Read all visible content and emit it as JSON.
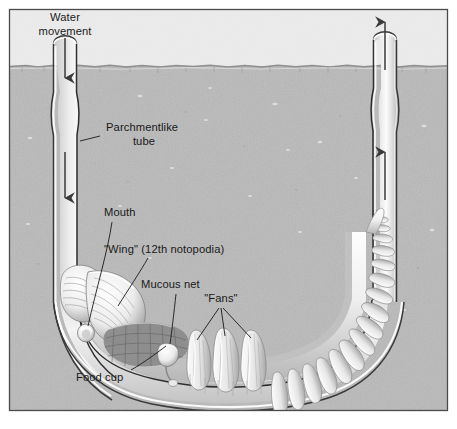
{
  "figure": {
    "background": {
      "water_color": "#eeeeee",
      "sediment_color": "#b9b9b9",
      "sediment_line_y": 66,
      "frame_color": "#4a4a4a"
    }
  },
  "labels": {
    "water_movement": {
      "line1": "Water",
      "line2": "movement"
    },
    "parchmentlike_tube": {
      "line1": "Parchmentlike",
      "line2": "tube"
    },
    "mouth": "Mouth",
    "wing": "\"Wing\" (12th notopodia)",
    "mucous_net": "Mucous net",
    "fans": "\"Fans\"",
    "food_cup": "Food cup"
  },
  "arrows": {
    "inflow": {
      "direction": "down",
      "meaning": "water entering left tube"
    },
    "inflow_lower": {
      "direction": "down",
      "meaning": "water moving down left tube"
    },
    "outflow_top": {
      "direction": "up",
      "meaning": "water exiting right tube"
    },
    "outflow_lower": {
      "direction": "up",
      "meaning": "water moving up right tube"
    }
  },
  "structures": {
    "tube": "U-shaped parchmentlike tube",
    "worm": "segmented worm body inside tube curve",
    "fan_count": 3,
    "parapodia_count": 26
  },
  "colors": {
    "tube_wall": "#3c3c3c",
    "tube_lumen": "#e4e4e4",
    "worm_body": "#f2f2f2",
    "worm_shadow": "#9a9a9a",
    "mucous_net": "#707070"
  }
}
